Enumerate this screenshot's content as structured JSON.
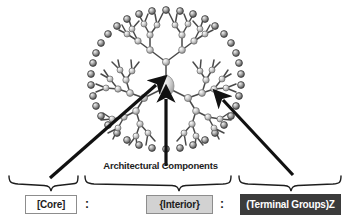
{
  "figure": {
    "caption": "Architectural Components",
    "separator": ":",
    "formula_parts": [
      {
        "id": "core",
        "label": "[Core]",
        "bracket": "square",
        "style": "white"
      },
      {
        "id": "interior",
        "label": "{Interior}",
        "bracket": "curly",
        "style": "light-gray"
      },
      {
        "id": "terminal",
        "label": "(Terminal Groups)Z",
        "bracket": "round",
        "style": "dark-gray"
      }
    ],
    "colors": {
      "core_fill": "#ffffff",
      "interior_fill": "#d2d2d2",
      "terminal_fill": "#3b3b3b",
      "terminal_text": "#ffffff",
      "box_border": "#8d8d8d",
      "ink": "#1d1d1d",
      "structure_line": "#3a3a3a",
      "sphere_light": "#d9d9d9",
      "sphere_mid": "#a8a8a8",
      "sphere_dark": "#5c5c5c"
    },
    "structure": {
      "name": "dendrimer-molecule",
      "description": "Oval dendritic branching structure with central core sphere, interior branch spheres and dense terminal group spheres on the periphery",
      "generations": 4,
      "core_branches": 3
    },
    "arrows": [
      {
        "id": "core-arrow",
        "points_to": "core",
        "from": [
          50,
          178
        ],
        "to": [
          158,
          84
        ]
      },
      {
        "id": "interior-arrow",
        "points_to": "interior",
        "from": [
          166,
          166
        ],
        "to": [
          166,
          98
        ]
      },
      {
        "id": "terminal-arrow",
        "points_to": "terminal",
        "from": [
          293,
          175
        ],
        "to": [
          221,
          99
        ]
      }
    ],
    "braces": [
      {
        "id": "core-brace",
        "x1": 8,
        "x2": 78,
        "tip": 51
      },
      {
        "id": "interior-brace",
        "x1": 84,
        "x2": 232,
        "tip": 179
      },
      {
        "id": "terminal-brace",
        "x1": 238,
        "x2": 342,
        "tip": 291
      }
    ]
  }
}
